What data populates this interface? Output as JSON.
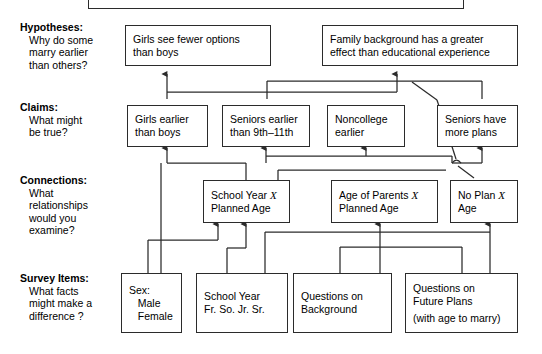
{
  "diagram": {
    "title_box_partial": "",
    "row_labels": [
      {
        "heading": "Hypotheses:",
        "question_lines": [
          "Why do some",
          "marry earlier",
          "than others?"
        ]
      },
      {
        "heading": "Claims:",
        "question_lines": [
          "What might",
          "be true?"
        ]
      },
      {
        "heading": "Connections:",
        "question_lines": [
          "What",
          "relationships",
          "would you",
          "examine?"
        ]
      },
      {
        "heading": "Survey Items:",
        "question_lines": [
          "What facts",
          "might make a",
          "difference ?"
        ]
      }
    ],
    "hypotheses": [
      {
        "lines": [
          "Girls see fewer options",
          "than boys"
        ]
      },
      {
        "lines": [
          "Family background has a greater",
          "effect than educational experience"
        ]
      }
    ],
    "claims": [
      {
        "lines": [
          "Girls earlier",
          "than boys"
        ]
      },
      {
        "lines": [
          "Seniors earlier",
          "than 9th–11th"
        ]
      },
      {
        "lines": [
          "Noncollege",
          "earlier"
        ]
      },
      {
        "lines": [
          "Seniors have",
          "more plans"
        ]
      }
    ],
    "connections": [
      {
        "lines": [
          "School Year X",
          "Planned Age"
        ],
        "italic_token": "X"
      },
      {
        "lines": [
          "Age of Parents X",
          "Planned Age"
        ],
        "italic_token": "X"
      },
      {
        "lines": [
          "No Plan X",
          "Age"
        ],
        "italic_token": "X"
      }
    ],
    "survey_items": [
      {
        "lines": [
          "Sex:",
          "   Male",
          "   Female"
        ]
      },
      {
        "lines": [
          "School Year",
          "Fr. So. Jr. Sr."
        ]
      },
      {
        "lines": [
          "Questions on",
          "Background"
        ]
      },
      {
        "lines": [
          "Questions on",
          "Future Plans",
          "(with age to marry)"
        ]
      }
    ],
    "colors": {
      "stroke": "#2b2b2b",
      "background": "#ffffff",
      "text": "#000000"
    }
  }
}
